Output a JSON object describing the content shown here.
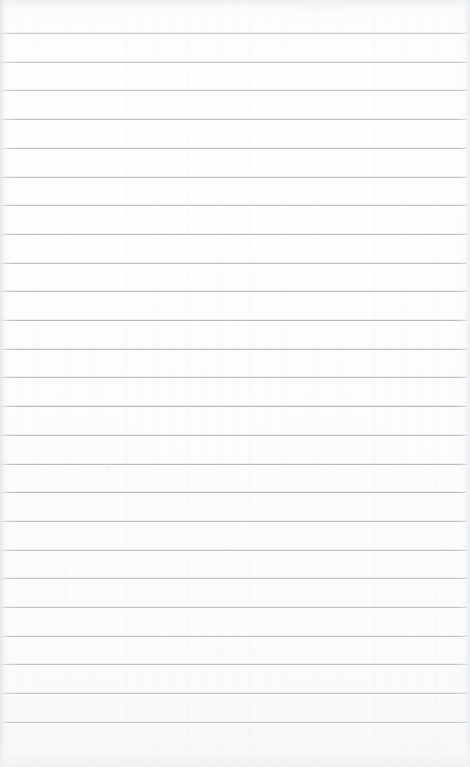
{
  "page": {
    "kind": "scanned-ruled-paper",
    "width_px": 470,
    "height_px": 767,
    "background_color": "#fdfdfd",
    "has_margin_rule": false,
    "has_header": false,
    "has_page_number": false,
    "has_handwriting": false,
    "text_content": ""
  },
  "ruling": {
    "line_color": "#b6babf",
    "line_thickness_px": 1,
    "line_spacing_px": 28.7,
    "first_line_y_px": 33,
    "last_line_y_px": 722,
    "line_count": 25,
    "line_inset_left_px": 2,
    "line_inset_right_px": 3,
    "line_y_positions": [
      33,
      61.7,
      90.4,
      119.1,
      147.8,
      176.5,
      205.2,
      233.9,
      262.6,
      291.3,
      320,
      348.7,
      377.4,
      406.1,
      434.8,
      463.5,
      492.2,
      520.9,
      549.6,
      578.3,
      607,
      635.7,
      664.4,
      693.1,
      721.8
    ]
  },
  "edges": {
    "left_shadow_color": "#e0e3e6",
    "right_shadow_color": "#e5e8eb",
    "top_shade_color": "#eceef0",
    "bottom_shade_color": "#eef0f2"
  },
  "blemishes": [
    {
      "name": "faint-mark-upper-left",
      "x_px": 106,
      "y_px": 464,
      "w_px": 4,
      "h_px": 9,
      "color": "#e9ebed",
      "opacity": 0.55
    },
    {
      "name": "faint-smudge-bottom-right",
      "x_px": 418,
      "y_px": 744,
      "w_px": 30,
      "h_px": 8,
      "color": "#f0f1f3",
      "opacity": 0.5
    },
    {
      "name": "faint-smudge-top-center",
      "x_px": 300,
      "y_px": 4,
      "w_px": 46,
      "h_px": 6,
      "color": "#eff1f2",
      "opacity": 0.45
    },
    {
      "name": "faint-smudge-bottom-left",
      "x_px": 120,
      "y_px": 752,
      "w_px": 34,
      "h_px": 7,
      "color": "#f1f2f4",
      "opacity": 0.4
    }
  ]
}
